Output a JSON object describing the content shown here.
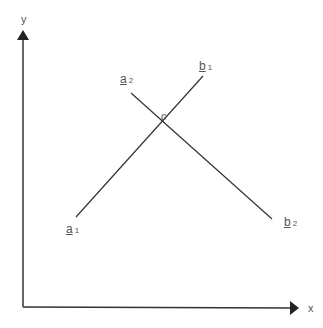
{
  "axes": {
    "x_label": "x",
    "y_label": "y"
  },
  "lines": [
    {
      "name": "a",
      "start": {
        "label": "a",
        "sub": "1",
        "x": 76,
        "y": 217
      },
      "end": {
        "label": "b",
        "sub": "1",
        "x": 203,
        "y": 76
      }
    },
    {
      "name": "b",
      "start": {
        "label": "a",
        "sub": "2",
        "x": 131,
        "y": 93
      },
      "end": {
        "label": "b",
        "sub": "2",
        "x": 272,
        "y": 219
      }
    }
  ],
  "intersection": {
    "label": "c"
  },
  "colors": {
    "line": "#333333"
  }
}
